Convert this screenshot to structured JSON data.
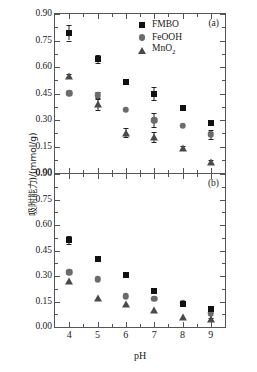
{
  "chart_data": {
    "type": "scatter",
    "title": "",
    "xlabel": "pH",
    "ylabel": "吸附能力)/(mmol/g)",
    "x": [
      4,
      5,
      6,
      7,
      8,
      9
    ],
    "xticklabels": [
      "4",
      "5",
      "6",
      "7",
      "8",
      "9"
    ],
    "xlim": [
      3.5,
      9.5
    ],
    "ylim": [
      0.0,
      0.9
    ],
    "yticks": [
      0.0,
      0.15,
      0.3,
      0.45,
      0.6,
      0.75,
      0.9
    ],
    "yticklabels": [
      "0.00",
      "0.15",
      "0.30",
      "0.45",
      "0.60",
      "0.75",
      "0.90"
    ],
    "grid": false,
    "legend_position": "top-center",
    "panels": [
      {
        "tag": "(a)",
        "series": [
          {
            "name": "FMBO",
            "marker": "square",
            "color": "#111111",
            "values": [
              0.795,
              0.645,
              0.515,
              0.45,
              0.37,
              0.283
            ],
            "errors": [
              0.045,
              0.022,
              0.0,
              0.038,
              0.015,
              0.0
            ]
          },
          {
            "name": "FeOOH",
            "marker": "circle",
            "color": "#6b6b6b",
            "values": [
              0.452,
              0.44,
              0.358,
              0.3,
              0.267,
              0.218
            ],
            "errors": [
              0.0,
              0.018,
              0.0,
              0.04,
              0.0,
              0.028
            ]
          },
          {
            "name": "MnO2",
            "marker": "triangle",
            "color": "#4a4a4a",
            "values": [
              0.548,
              0.388,
              0.228,
              0.203,
              0.14,
              0.062
            ],
            "errors": [
              0.012,
              0.03,
              0.025,
              0.03,
              0.012,
              0.01
            ]
          }
        ]
      },
      {
        "tag": "(b)",
        "series": [
          {
            "name": "FMBO",
            "marker": "square",
            "color": "#111111",
            "values": [
              0.512,
              0.4,
              0.305,
              0.213,
              0.138,
              0.105
            ],
            "errors": [
              0.022,
              0.0,
              0.0,
              0.0,
              0.0,
              0.0
            ]
          },
          {
            "name": "FeOOH",
            "marker": "circle",
            "color": "#6b6b6b",
            "values": [
              0.323,
              0.28,
              0.182,
              0.165,
              0.143,
              0.082
            ],
            "errors": [
              0.0,
              0.0,
              0.0,
              0.0,
              0.0,
              0.0
            ]
          },
          {
            "name": "MnO2",
            "marker": "triangle",
            "color": "#4a4a4a",
            "values": [
              0.27,
              0.172,
              0.135,
              0.098,
              0.058,
              0.045
            ],
            "errors": [
              0.0,
              0.0,
              0.0,
              0.0,
              0.0,
              0.01
            ]
          }
        ]
      }
    ]
  },
  "legend": {
    "items": [
      {
        "label": "FMBO",
        "marker": "square"
      },
      {
        "label": "FeOOH",
        "marker": "circle"
      },
      {
        "label": "MnO",
        "sub": "2",
        "marker": "triangle"
      }
    ]
  },
  "labels": {
    "xlabel": "pH",
    "ylabel": "吸附能力)/(mmol/g)",
    "panel_a": "(a)",
    "panel_b": "(b)"
  }
}
